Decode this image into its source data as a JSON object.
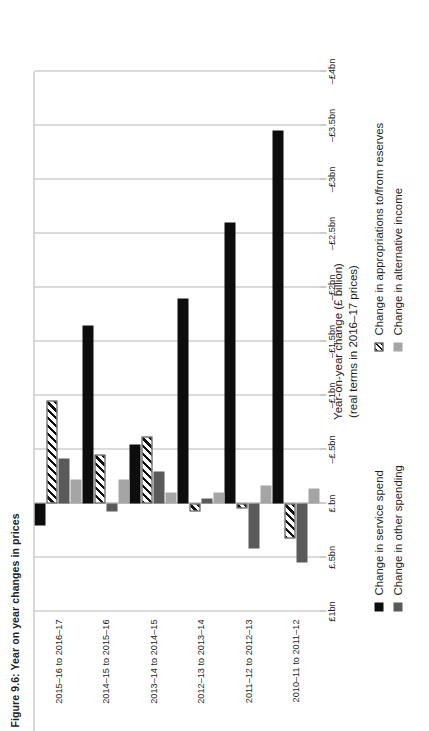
{
  "figure": {
    "title": "Figure 9.6: Year on year changes in prices"
  },
  "axis": {
    "value_axis_title_line1": "Year-on-year change (£ billion)",
    "value_axis_title_line2": "(real terms in 2016–17 prices)"
  },
  "legend": {
    "items": [
      {
        "key": "service",
        "label": "Change in service spend",
        "color": "#0d0d0d",
        "pattern": "solid"
      },
      {
        "key": "other",
        "label": "Change in other spending",
        "color": "#5a5a5a",
        "pattern": "solid"
      },
      {
        "key": "approp",
        "label": "Change in appropriations to/from reserves",
        "color": "#ffffff",
        "pattern": "diagonal-hatch"
      },
      {
        "key": "alt",
        "label": "Change in alternative income",
        "color": "#a5a5a5",
        "pattern": "solid"
      }
    ]
  },
  "chart_data": {
    "type": "bar",
    "orientation": "horizontal-rotated",
    "title": "Figure 9.6: Year on year changes in prices",
    "xlabel": "",
    "ylabel": "Year-on-year change (£ billion) (real terms in 2016–17 prices)",
    "ylim": [
      -4.0,
      1.0
    ],
    "grid": true,
    "legend_position": "bottom",
    "tick_labels": [
      "£1bn",
      "£.5bn",
      "£.bn",
      "–£.5bn",
      "–£1bn",
      "–£1.5bn",
      "–£2bn",
      "–£2.5bn",
      "–£3bn",
      "–£3.5bn",
      "–£4bn"
    ],
    "tick_values": [
      1.0,
      0.5,
      0.0,
      -0.5,
      -1.0,
      -1.5,
      -2.0,
      -2.5,
      -3.0,
      -3.5,
      -4.0
    ],
    "categories": [
      "2010–11 to 2011–12",
      "2011–12 to 2012–13",
      "2012–13 to 2013–14",
      "2013–14 to 2014–15",
      "2014–15 to 2015–16",
      "2015–16 to 2016–17"
    ],
    "series": [
      {
        "name": "Change in service spend",
        "key": "service",
        "values": [
          -3.45,
          -2.6,
          -1.9,
          -0.55,
          -1.65,
          0.2
        ]
      },
      {
        "name": "Change in appropriations to/from reserves",
        "key": "approp",
        "values": [
          0.32,
          0.05,
          0.07,
          -0.62,
          -0.45,
          -0.95
        ]
      },
      {
        "name": "Change in other spending",
        "key": "other",
        "values": [
          0.55,
          0.42,
          -0.05,
          -0.3,
          0.07,
          -0.42
        ]
      },
      {
        "name": "Change in alternative income",
        "key": "alt",
        "values": [
          -0.14,
          -0.17,
          -0.1,
          -0.1,
          -0.22,
          -0.22
        ]
      }
    ]
  }
}
